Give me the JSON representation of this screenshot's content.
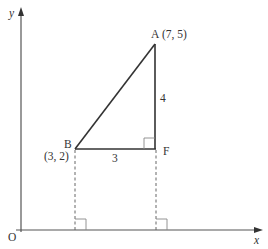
{
  "diagram": {
    "type": "coordinate-geometry-right-triangle",
    "axes": {
      "x_label": "x",
      "y_label": "y",
      "origin_label": "O"
    },
    "points": {
      "A": {
        "label": "A",
        "coords_text": "(7, 5)",
        "x": 7,
        "y": 5
      },
      "B": {
        "label": "B",
        "coords_text": "(3, 2)",
        "x": 3,
        "y": 2
      },
      "F": {
        "label": "F"
      }
    },
    "sides": {
      "BF_length": "3",
      "AF_length": "4"
    },
    "colors": {
      "line": "#333333",
      "axis": "#555555",
      "dashed": "#666666",
      "right_angle": "#888888"
    }
  }
}
